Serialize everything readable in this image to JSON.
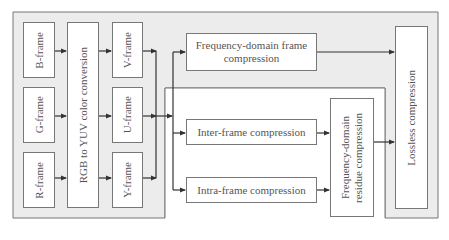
{
  "diagram": {
    "colors": {
      "frame_bg": "#ececec",
      "box_bg": "#ffffff",
      "line": "#555555",
      "border": "#777777"
    },
    "nodes": {
      "b_frame": "B-frame",
      "g_frame": "G-frame",
      "r_frame": "R-frame",
      "rgb_to_yuv": "RGB to YUV color conversion",
      "v_frame": "V-frame",
      "u_frame": "U-frame",
      "y_frame": "Y-frame",
      "freq_frame": "Frequency-domain frame compression",
      "inter_frame": "Inter-frame compression",
      "intra_frame": "Intra-frame compression",
      "freq_residue": "Frequency-domain residue compression",
      "lossless": "Lossless compression"
    },
    "edges": [
      [
        "B-frame",
        "RGB to YUV color conversion"
      ],
      [
        "G-frame",
        "RGB to YUV color conversion"
      ],
      [
        "R-frame",
        "RGB to YUV color conversion"
      ],
      [
        "RGB to YUV color conversion",
        "V-frame"
      ],
      [
        "RGB to YUV color conversion",
        "U-frame"
      ],
      [
        "RGB to YUV color conversion",
        "Y-frame"
      ],
      [
        "V-frame/U-frame/Y-frame",
        "Frequency-domain frame compression"
      ],
      [
        "V-frame/U-frame/Y-frame",
        "Inter-frame compression"
      ],
      [
        "V-frame/U-frame/Y-frame",
        "Intra-frame compression"
      ],
      [
        "Frequency-domain frame compression",
        "Lossless compression"
      ],
      [
        "Inter-frame compression",
        "Frequency-domain residue compression"
      ],
      [
        "Intra-frame compression",
        "Frequency-domain residue compression"
      ],
      [
        "Frequency-domain residue compression",
        "Lossless compression"
      ]
    ]
  }
}
